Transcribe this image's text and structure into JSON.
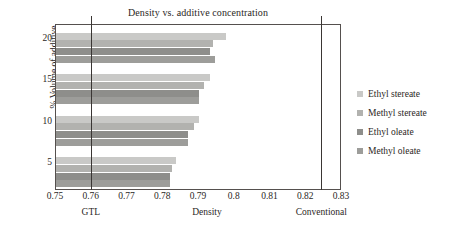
{
  "chart_data": {
    "type": "bar",
    "orientation": "horizontal",
    "title": "Density vs. additive concentration",
    "xlabel": "Density",
    "ylabel": "% Volume of additive",
    "xlim": [
      0.75,
      0.83
    ],
    "ylim": [
      0,
      4
    ],
    "grid": false,
    "legend_position": "right",
    "x_tick_labels": [
      "0.75",
      "0.76",
      "0.77",
      "0.78",
      "0.79",
      "0.8",
      "0.81",
      "0.82",
      "0.83"
    ],
    "x_tick_values": [
      0.75,
      0.76,
      0.77,
      0.78,
      0.79,
      0.8,
      0.81,
      0.82,
      0.83
    ],
    "categories": [
      "5",
      "10",
      "15",
      "20"
    ],
    "category_labels": [
      "5",
      "10",
      "15",
      "20"
    ],
    "series": [
      {
        "name": "Ethyl stereate",
        "color": "#c9c9c7",
        "values": [
          0.7835,
          0.79,
          0.793,
          0.7975
        ]
      },
      {
        "name": "Methyl stereate",
        "color": "#b2b2af",
        "values": [
          0.7825,
          0.7885,
          0.7915,
          0.794
        ]
      },
      {
        "name": "Ethyl oleate",
        "color": "#8e8e8b",
        "values": [
          0.782,
          0.787,
          0.79,
          0.793
        ]
      },
      {
        "name": "Methyl oleate",
        "color": "#9d9d9a",
        "values": [
          0.782,
          0.787,
          0.79,
          0.7945
        ]
      }
    ],
    "reference_lines": [
      {
        "label": "GTL",
        "value": 0.76
      },
      {
        "label": "Conventional",
        "value": 0.8245
      }
    ],
    "axis_note_center": {
      "label": "Density",
      "value": 0.7925
    }
  }
}
